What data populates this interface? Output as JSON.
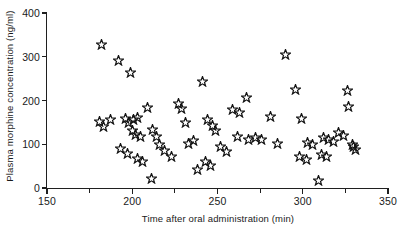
{
  "chart_data": {
    "type": "scatter",
    "title": "",
    "xlabel": "Time after oral administration (min)",
    "ylabel": "Plasma morphine concentration (ng/ml)",
    "xlim": [
      150,
      350
    ],
    "ylim": [
      0,
      400
    ],
    "xticks": [
      150,
      200,
      250,
      300,
      350
    ],
    "xtick_labels": [
      "150",
      "200",
      "250",
      "300",
      "350"
    ],
    "xminor_step": 25,
    "yticks": [
      0,
      100,
      200,
      300,
      400
    ],
    "ytick_labels": [
      "0",
      "100",
      "200",
      "300",
      "400"
    ],
    "grid": false,
    "legend": null,
    "marker": "star-outline",
    "marker_color": "#141414",
    "series": [
      {
        "name": "plasma morphine concentration",
        "points": [
          [
            182,
            329
          ],
          [
            192,
            292
          ],
          [
            199,
            264
          ],
          [
            181,
            152
          ],
          [
            183,
            140
          ],
          [
            187,
            157
          ],
          [
            196,
            160
          ],
          [
            198,
            150
          ],
          [
            201,
            156
          ],
          [
            203,
            162
          ],
          [
            200,
            131
          ],
          [
            202,
            122
          ],
          [
            205,
            118
          ],
          [
            193,
            90
          ],
          [
            197,
            78
          ],
          [
            203,
            68
          ],
          [
            206,
            61
          ],
          [
            209,
            185
          ],
          [
            212,
            133
          ],
          [
            214,
            118
          ],
          [
            216,
            100
          ],
          [
            211,
            21
          ],
          [
            219,
            86
          ],
          [
            223,
            73
          ],
          [
            227,
            193
          ],
          [
            229,
            182
          ],
          [
            231,
            149
          ],
          [
            233,
            102
          ],
          [
            236,
            108
          ],
          [
            238,
            43
          ],
          [
            241,
            243
          ],
          [
            244,
            157
          ],
          [
            247,
            144
          ],
          [
            249,
            132
          ],
          [
            252,
            96
          ],
          [
            255,
            84
          ],
          [
            243,
            60
          ],
          [
            246,
            52
          ],
          [
            259,
            180
          ],
          [
            263,
            172
          ],
          [
            267,
            206
          ],
          [
            262,
            118
          ],
          [
            268,
            112
          ],
          [
            272,
            116
          ],
          [
            276,
            110
          ],
          [
            281,
            164
          ],
          [
            285,
            102
          ],
          [
            290,
            305
          ],
          [
            296,
            225
          ],
          [
            299,
            160
          ],
          [
            303,
            104
          ],
          [
            306,
            100
          ],
          [
            298,
            72
          ],
          [
            302,
            66
          ],
          [
            312,
            115
          ],
          [
            315,
            110
          ],
          [
            318,
            107
          ],
          [
            311,
            76
          ],
          [
            314,
            72
          ],
          [
            309,
            18
          ],
          [
            326,
            224
          ],
          [
            327,
            186
          ],
          [
            321,
            127
          ],
          [
            324,
            120
          ],
          [
            329,
            100
          ],
          [
            330,
            94
          ],
          [
            331,
            88
          ]
        ]
      }
    ]
  },
  "axes": {
    "y_title": "Plasma morphine concentration (ng/ml)",
    "x_title": "Time after oral administration (min)"
  }
}
